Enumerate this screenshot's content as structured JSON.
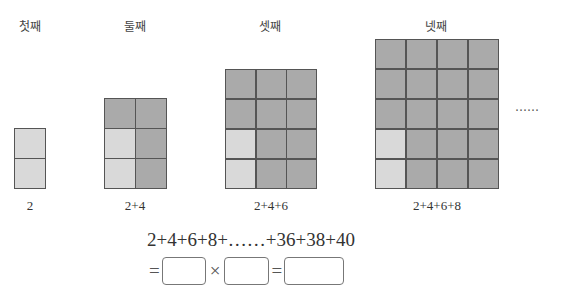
{
  "figures": [
    {
      "title": "첫째",
      "label": "2",
      "cols": 1,
      "rows": 2,
      "light_cells": [
        0,
        1
      ]
    },
    {
      "title": "둘째",
      "label": "2+4",
      "cols": 2,
      "rows": 3,
      "light_cells": [
        2,
        4
      ]
    },
    {
      "title": "셋째",
      "label": "2+4+6",
      "cols": 3,
      "rows": 4,
      "light_cells": [
        6,
        9
      ]
    },
    {
      "title": "넷째",
      "label": "2+4+6+8",
      "cols": 4,
      "rows": 5,
      "light_cells": [
        12,
        16
      ]
    }
  ],
  "ellipsis": "……",
  "formula": {
    "line1": "2+4+6+8+……+36+38+40",
    "eq1": "=",
    "times": "×",
    "eq2": "="
  },
  "colors": {
    "dark_cell": "#aaaaaa",
    "light_cell": "#d9d9d9",
    "border": "#555555"
  }
}
